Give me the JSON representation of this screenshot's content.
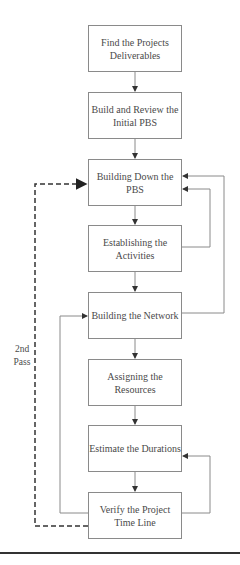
{
  "diagram": {
    "type": "flowchart",
    "steps": [
      {
        "label": "Find the Projects Deliverables"
      },
      {
        "label": "Build and Review the Initial PBS"
      },
      {
        "label": "Building Down the PBS"
      },
      {
        "label": "Establishing the Activities"
      },
      {
        "label": "Building the Network"
      },
      {
        "label": "Assigning the Resources"
      },
      {
        "label": "Estimate the Durations"
      },
      {
        "label": "Verify the Project Time Line"
      }
    ],
    "loop_label": "2nd Pass",
    "feedback_edges": [
      {
        "from": "Establishing the Activities",
        "to": "Building Down the PBS"
      },
      {
        "from": "Building the Network",
        "to": "Building Down the PBS"
      },
      {
        "from": "Verify the Project Time Line",
        "to": "Estimate the Durations"
      },
      {
        "from": "Verify the Project Time Line",
        "to": "Building the Network"
      },
      {
        "from": "Verify the Project Time Line",
        "to": "Building Down the PBS",
        "style": "dashed",
        "label": "2nd Pass"
      }
    ],
    "colors": {
      "line": "#8a8a8a",
      "text": "#4a4a4a",
      "dashed": "#333333"
    }
  }
}
